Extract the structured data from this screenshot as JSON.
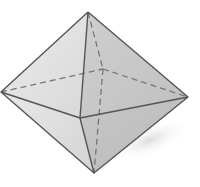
{
  "figure": {
    "vertices": {
      "top": [
        88,
        12
      ],
      "left": [
        1,
        92
      ],
      "right": [
        188,
        97
      ],
      "front": [
        80,
        118
      ],
      "back": [
        103,
        69
      ],
      "bottom": [
        94,
        173
      ]
    },
    "colors": {
      "edge": "#555555",
      "hidden_edge": "#777777",
      "face_light": "#e2e2e2",
      "face_mid": "#d2d2d2",
      "face_dark": "#bdbdbd",
      "shadow": "#e6e6e6"
    }
  }
}
